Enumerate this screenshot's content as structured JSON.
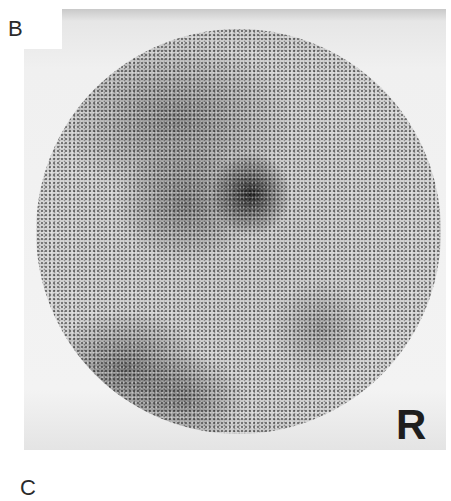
{
  "figure": {
    "panel_label_top": "B",
    "panel_label_bottom": "C",
    "orientation_marker": "R",
    "image_description": "Grayscale circular scintigraphic (nuclear medicine) scan with a focal area of increased uptake near the upper center"
  }
}
